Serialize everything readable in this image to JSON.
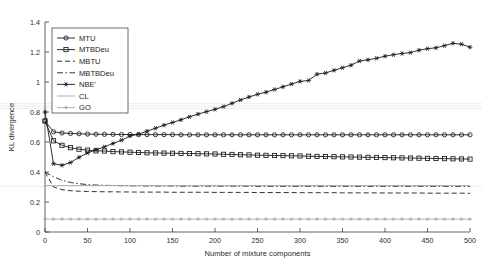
{
  "chart_data": {
    "type": "line",
    "title": "",
    "xlabel": "Number of mixture components",
    "ylabel": "KL divergence",
    "xlim": [
      0,
      500
    ],
    "ylim": [
      0,
      1.4
    ],
    "xticks": [
      0,
      50,
      100,
      150,
      200,
      250,
      300,
      350,
      400,
      450,
      500
    ],
    "yticks": [
      0,
      0.2,
      0.4,
      0.6,
      0.8,
      1,
      1.2,
      1.4
    ],
    "xticklabels": [
      "0",
      "50",
      "100",
      "150",
      "200",
      "250",
      "300",
      "350",
      "400",
      "450",
      "500"
    ],
    "yticklabels": [
      "0",
      "0.2",
      "0.4",
      "0.6",
      "0.8",
      "1",
      "1.2",
      "1.4"
    ],
    "grid": false,
    "legend_position": "upper-left",
    "x": [
      0,
      10,
      20,
      30,
      40,
      50,
      60,
      70,
      80,
      90,
      100,
      110,
      120,
      130,
      140,
      150,
      160,
      170,
      180,
      190,
      200,
      210,
      220,
      230,
      240,
      250,
      260,
      270,
      280,
      290,
      300,
      310,
      320,
      330,
      340,
      350,
      360,
      370,
      380,
      390,
      400,
      410,
      420,
      430,
      440,
      450,
      460,
      470,
      480,
      490,
      500
    ],
    "series": [
      {
        "name": "MTU",
        "marker": "circle",
        "linestyle": "solid",
        "color": "#1a1a1a",
        "values": [
          0.74,
          0.668,
          0.66,
          0.657,
          0.655,
          0.653,
          0.652,
          0.651,
          0.651,
          0.65,
          0.65,
          0.649,
          0.649,
          0.649,
          0.649,
          0.649,
          0.648,
          0.648,
          0.648,
          0.648,
          0.648,
          0.648,
          0.648,
          0.648,
          0.648,
          0.648,
          0.648,
          0.648,
          0.648,
          0.648,
          0.648,
          0.648,
          0.648,
          0.648,
          0.648,
          0.648,
          0.648,
          0.648,
          0.648,
          0.648,
          0.648,
          0.648,
          0.648,
          0.648,
          0.648,
          0.648,
          0.648,
          0.648,
          0.648,
          0.648,
          0.648
        ]
      },
      {
        "name": "MTBDeu",
        "marker": "square",
        "linestyle": "solid",
        "color": "#1a1a1a",
        "values": [
          0.74,
          0.608,
          0.578,
          0.562,
          0.552,
          0.546,
          0.541,
          0.54,
          0.536,
          0.534,
          0.532,
          0.53,
          0.528,
          0.527,
          0.526,
          0.525,
          0.524,
          0.523,
          0.522,
          0.521,
          0.52,
          0.518,
          0.517,
          0.515,
          0.514,
          0.512,
          0.511,
          0.51,
          0.509,
          0.508,
          0.507,
          0.505,
          0.504,
          0.503,
          0.502,
          0.501,
          0.5,
          0.499,
          0.498,
          0.497,
          0.496,
          0.495,
          0.494,
          0.493,
          0.492,
          0.491,
          0.49,
          0.489,
          0.488,
          0.487,
          0.486
        ]
      },
      {
        "name": "MBTU",
        "marker": "none",
        "linestyle": "dashed",
        "color": "#1a1a1a",
        "values": [
          0.4,
          0.3,
          0.282,
          0.275,
          0.272,
          0.27,
          0.269,
          0.268,
          0.268,
          0.267,
          0.267,
          0.266,
          0.266,
          0.266,
          0.266,
          0.265,
          0.265,
          0.265,
          0.265,
          0.265,
          0.264,
          0.264,
          0.264,
          0.264,
          0.264,
          0.263,
          0.263,
          0.263,
          0.263,
          0.263,
          0.262,
          0.262,
          0.262,
          0.262,
          0.262,
          0.261,
          0.261,
          0.261,
          0.261,
          0.261,
          0.26,
          0.26,
          0.26,
          0.26,
          0.26,
          0.259,
          0.259,
          0.259,
          0.259,
          0.259,
          0.258
        ]
      },
      {
        "name": "MBTBDeu",
        "marker": "none",
        "linestyle": "dashdot",
        "color": "#1a1a1a",
        "values": [
          0.4,
          0.368,
          0.345,
          0.33,
          0.322,
          0.316,
          0.313,
          0.311,
          0.31,
          0.309,
          0.308,
          0.308,
          0.307,
          0.307,
          0.307,
          0.307,
          0.306,
          0.306,
          0.306,
          0.306,
          0.306,
          0.306,
          0.306,
          0.306,
          0.306,
          0.305,
          0.305,
          0.305,
          0.305,
          0.305,
          0.305,
          0.305,
          0.305,
          0.305,
          0.305,
          0.305,
          0.305,
          0.305,
          0.305,
          0.305,
          0.305,
          0.305,
          0.305,
          0.305,
          0.305,
          0.305,
          0.305,
          0.305,
          0.305,
          0.305,
          0.305
        ]
      },
      {
        "name": "NBE'",
        "marker": "asterisk",
        "linestyle": "solid",
        "color": "#1a1a1a",
        "values": [
          0.8,
          0.455,
          0.445,
          0.463,
          0.498,
          0.527,
          0.548,
          0.568,
          0.59,
          0.612,
          0.64,
          0.652,
          0.672,
          0.692,
          0.712,
          0.73,
          0.748,
          0.768,
          0.786,
          0.802,
          0.818,
          0.836,
          0.858,
          0.88,
          0.9,
          0.918,
          0.932,
          0.95,
          0.968,
          0.986,
          1.004,
          1.01,
          1.052,
          1.06,
          1.078,
          1.095,
          1.112,
          1.14,
          1.148,
          1.158,
          1.172,
          1.182,
          1.19,
          1.196,
          1.212,
          1.222,
          1.228,
          1.242,
          1.258,
          1.252,
          1.232
        ]
      },
      {
        "name": "CL",
        "marker": "none",
        "linestyle": "solid",
        "color": "#a8a8a8",
        "values": [
          0.31,
          0.31,
          0.31,
          0.31,
          0.31,
          0.31,
          0.31,
          0.31,
          0.31,
          0.31,
          0.31,
          0.31,
          0.31,
          0.31,
          0.31,
          0.31,
          0.31,
          0.31,
          0.31,
          0.31,
          0.31,
          0.31,
          0.31,
          0.31,
          0.31,
          0.31,
          0.31,
          0.31,
          0.31,
          0.31,
          0.31,
          0.31,
          0.31,
          0.31,
          0.31,
          0.31,
          0.31,
          0.31,
          0.31,
          0.31,
          0.31,
          0.31,
          0.31,
          0.31,
          0.31,
          0.31,
          0.31,
          0.31,
          0.31,
          0.31,
          0.31
        ]
      },
      {
        "name": "GO",
        "marker": "star",
        "linestyle": "solid",
        "color": "#a8a8a8",
        "values": [
          0.086,
          0.086,
          0.086,
          0.086,
          0.086,
          0.086,
          0.086,
          0.086,
          0.086,
          0.086,
          0.086,
          0.086,
          0.086,
          0.086,
          0.086,
          0.086,
          0.086,
          0.086,
          0.086,
          0.086,
          0.086,
          0.086,
          0.086,
          0.086,
          0.086,
          0.086,
          0.086,
          0.086,
          0.086,
          0.086,
          0.086,
          0.086,
          0.086,
          0.086,
          0.086,
          0.086,
          0.086,
          0.086,
          0.086,
          0.086,
          0.086,
          0.086,
          0.086,
          0.086,
          0.086,
          0.086,
          0.086,
          0.086,
          0.086,
          0.086,
          0.086
        ]
      }
    ]
  },
  "legend": {
    "entries": [
      {
        "label": "MTU",
        "marker": "circle",
        "linestyle": "solid",
        "color": "#1a1a1a"
      },
      {
        "label": "MTBDeu",
        "marker": "square",
        "linestyle": "solid",
        "color": "#1a1a1a"
      },
      {
        "label": "MBTU",
        "marker": "none",
        "linestyle": "dashed",
        "color": "#1a1a1a"
      },
      {
        "label": "MBTBDeu",
        "marker": "none",
        "linestyle": "dashdot",
        "color": "#1a1a1a"
      },
      {
        "label": "NBE'",
        "marker": "asterisk",
        "linestyle": "solid",
        "color": "#1a1a1a"
      },
      {
        "label": "CL",
        "marker": "none",
        "linestyle": "solid",
        "color": "#a8a8a8"
      },
      {
        "label": "GO",
        "marker": "star",
        "linestyle": "solid",
        "color": "#a8a8a8"
      }
    ]
  }
}
